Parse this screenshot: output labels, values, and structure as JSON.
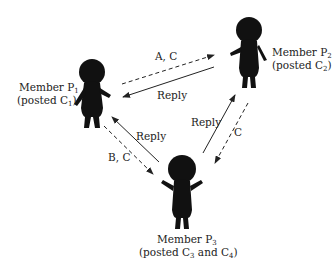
{
  "diagram": {
    "colors": {
      "figure": "#111111",
      "line": "#222222",
      "text": "#222222",
      "background": "#ffffff"
    },
    "members": [
      {
        "id": "P1",
        "name": "Member P",
        "sub": "1",
        "posted_prefix": "(posted C",
        "posted_sub": "1",
        "posted_suffix": ")"
      },
      {
        "id": "P2",
        "name": "Member P",
        "sub": "2",
        "posted_prefix": "(posted C",
        "posted_sub": "2",
        "posted_suffix": ")"
      },
      {
        "id": "P3",
        "name": "Member P",
        "sub": "3",
        "posted_prefix": "(posted C",
        "posted_sub": "3",
        "posted_mid": " and C",
        "posted_sub2": "4",
        "posted_suffix": ")"
      }
    ],
    "edges": [
      {
        "from": "P1",
        "to": "P2",
        "style": "dashed",
        "label": "A, C"
      },
      {
        "from": "P2",
        "to": "P1",
        "style": "solid",
        "label": "Reply"
      },
      {
        "from": "P3",
        "to": "P1",
        "style": "solid",
        "label": "Reply"
      },
      {
        "from": "P1",
        "to": "P3",
        "style": "dashed",
        "label": "B, C"
      },
      {
        "from": "P3",
        "to": "P2",
        "style": "solid",
        "label": "Reply"
      },
      {
        "from": "P2",
        "to": "P3",
        "style": "dashed",
        "label": "C"
      }
    ]
  }
}
